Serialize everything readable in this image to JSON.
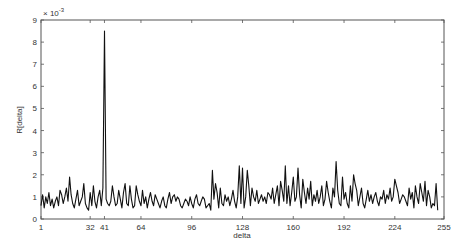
{
  "chart_data": {
    "type": "line",
    "title": "",
    "xlabel": "delta",
    "ylabel": "R[delta]",
    "y_multiplier_label": "× 10",
    "y_multiplier_exponent": "-3",
    "xlim": [
      1,
      255
    ],
    "ylim": [
      0,
      9
    ],
    "y_scale": 0.001,
    "grid": false,
    "legend": null,
    "x_ticks": [
      1,
      32,
      41,
      64,
      96,
      128,
      160,
      192,
      224,
      255
    ],
    "y_ticks": [
      0,
      1,
      2,
      3,
      4,
      5,
      6,
      7,
      8,
      9
    ],
    "line_color": "#111111",
    "annotations": [
      {
        "x": 41,
        "y": 8.5,
        "note": "dominant spike"
      }
    ],
    "x": "1..255",
    "series": [
      {
        "name": "R[delta]",
        "values": [
          0.6,
          1.1,
          0.5,
          1.0,
          0.7,
          1.2,
          0.6,
          0.9,
          0.5,
          0.8,
          1.0,
          0.6,
          1.3,
          1.1,
          0.7,
          1.0,
          1.4,
          0.8,
          1.9,
          1.1,
          0.7,
          0.5,
          0.9,
          1.3,
          0.6,
          0.8,
          1.0,
          1.6,
          0.7,
          0.5,
          0.4,
          1.2,
          0.6,
          1.5,
          0.8,
          0.5,
          1.0,
          1.3,
          0.6,
          1.4,
          8.5,
          0.9,
          0.7,
          0.6,
          0.8,
          1.5,
          1.0,
          0.6,
          0.7,
          1.3,
          0.9,
          0.5,
          1.2,
          1.6,
          0.7,
          0.6,
          1.5,
          0.9,
          0.5,
          0.6,
          1.5,
          1.1,
          0.8,
          0.6,
          1.3,
          0.7,
          1.0,
          0.5,
          0.9,
          1.2,
          0.8,
          0.6,
          1.1,
          0.9,
          0.7,
          0.5,
          0.8,
          1.0,
          0.6,
          0.5,
          0.9,
          1.2,
          0.7,
          1.0,
          1.1,
          0.8,
          1.0,
          0.9,
          0.6,
          0.5,
          0.7,
          0.9,
          0.8,
          0.6,
          1.0,
          0.7,
          0.5,
          0.9,
          1.1,
          0.7,
          0.6,
          0.8,
          1.0,
          0.9,
          0.5,
          0.6,
          0.7,
          0.4,
          2.2,
          0.9,
          1.6,
          1.2,
          0.5,
          1.4,
          0.7,
          0.6,
          1.1,
          0.8,
          1.0,
          0.6,
          0.9,
          1.3,
          0.8,
          0.5,
          1.0,
          2.4,
          0.7,
          2.3,
          0.5,
          1.0,
          2.2,
          1.5,
          0.6,
          1.4,
          1.0,
          0.8,
          1.3,
          0.7,
          0.9,
          1.1,
          0.8,
          1.0,
          0.7,
          1.2,
          1.1,
          0.9,
          1.4,
          0.7,
          1.1,
          1.5,
          0.6,
          1.7,
          1.3,
          0.8,
          2.4,
          0.7,
          1.5,
          0.6,
          1.2,
          1.9,
          0.8,
          1.0,
          2.3,
          1.1,
          0.5,
          1.8,
          1.2,
          0.7,
          1.4,
          0.9,
          1.7,
          0.6,
          1.1,
          0.8,
          1.3,
          0.7,
          1.0,
          1.5,
          0.6,
          0.9,
          1.7,
          1.2,
          0.8,
          0.5,
          1.4,
          1.0,
          2.6,
          1.3,
          0.7,
          0.6,
          1.9,
          0.9,
          1.2,
          0.7,
          0.5,
          1.5,
          0.8,
          2.0,
          1.6,
          1.3,
          0.6,
          1.0,
          1.4,
          0.7,
          0.5,
          0.9,
          1.3,
          0.8,
          1.1,
          0.7,
          1.0,
          1.2,
          0.8,
          0.6,
          1.0,
          0.9,
          1.3,
          0.7,
          1.1,
          0.9,
          1.4,
          0.8,
          1.0,
          1.8,
          1.5,
          1.2,
          0.7,
          0.9,
          1.1,
          1.0,
          0.8,
          0.6,
          1.4,
          0.9,
          1.2,
          0.5,
          1.5,
          1.0,
          0.7,
          1.6,
          1.2,
          0.8,
          1.7,
          0.6,
          1.3,
          1.0,
          0.5,
          0.7,
          0.6,
          1.6,
          0.4
        ]
      }
    ]
  }
}
